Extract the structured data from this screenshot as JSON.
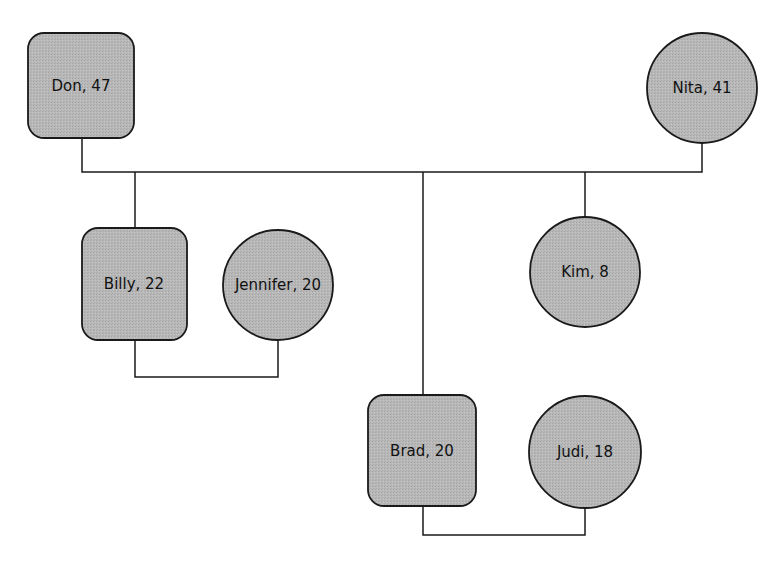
{
  "diagram": {
    "type": "genogram",
    "colors": {
      "node_fill": "#b5b5b5",
      "stroke": "#1a1a1a",
      "background": "#ffffff"
    },
    "legend": {
      "male_shape": "rounded-square",
      "female_shape": "circle"
    },
    "nodes": [
      {
        "id": "don",
        "label": "Don, 47",
        "name": "Don",
        "age": 47,
        "shape": "rounded-square",
        "generation": 1
      },
      {
        "id": "nita",
        "label": "Nita, 41",
        "name": "Nita",
        "age": 41,
        "shape": "circle",
        "generation": 1
      },
      {
        "id": "billy",
        "label": "Billy, 22",
        "name": "Billy",
        "age": 22,
        "shape": "rounded-square",
        "generation": 2
      },
      {
        "id": "jennifer",
        "label": "Jennifer, 20",
        "name": "Jennifer",
        "age": 20,
        "shape": "circle",
        "generation": 2
      },
      {
        "id": "kim",
        "label": "Kim, 8",
        "name": "Kim",
        "age": 8,
        "shape": "circle",
        "generation": 2
      },
      {
        "id": "brad",
        "label": "Brad, 20",
        "name": "Brad",
        "age": 20,
        "shape": "rounded-square",
        "generation": 2
      },
      {
        "id": "judi",
        "label": "Judi, 18",
        "name": "Judi",
        "age": 18,
        "shape": "circle",
        "generation": 2
      }
    ],
    "relationships": [
      {
        "type": "couple",
        "members": [
          "don",
          "nita"
        ],
        "children": [
          "billy",
          "brad",
          "kim"
        ]
      },
      {
        "type": "couple",
        "members": [
          "billy",
          "jennifer"
        ]
      },
      {
        "type": "couple",
        "members": [
          "brad",
          "judi"
        ]
      }
    ]
  }
}
